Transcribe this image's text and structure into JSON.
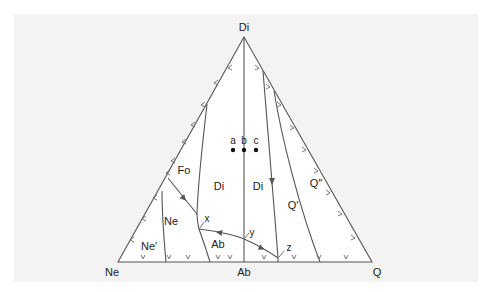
{
  "diagram": {
    "type": "ternary-phase-diagram",
    "vertices": {
      "top": "Di",
      "bottom_left": "Ne",
      "bottom_middle": "Ab",
      "bottom_right": "Q"
    },
    "fields": {
      "fo": "Fo",
      "di_left": "Di",
      "di_right": "Di",
      "ne": "Ne",
      "ne_prime": "Ne′",
      "ab": "Ab",
      "q_prime": "Q′",
      "q_double_prime": "Q″"
    },
    "points": {
      "a": "a",
      "b": "b",
      "c": "c",
      "x": "x",
      "y": "y",
      "z": "z"
    },
    "colors": {
      "panel": "#f3f3f3",
      "triangle_fill": "#ffffff",
      "lines": "#555555",
      "text": "#222222"
    }
  }
}
